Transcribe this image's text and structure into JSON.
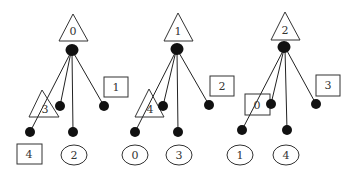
{
  "diagram": {
    "type": "game-tree-set",
    "trees": [
      {
        "root_label": "0",
        "root_shape": "triangle",
        "leaves": [
          {
            "label": "3",
            "shape": "triangle",
            "attached_to": "branch-1"
          },
          {
            "label": "1",
            "shape": "square",
            "attached_to": "branch-4"
          },
          {
            "label": "4",
            "shape": "square",
            "attached_to": "branch-1"
          },
          {
            "label": "2",
            "shape": "circle",
            "attached_to": "branch-3"
          }
        ]
      },
      {
        "root_label": "1",
        "root_shape": "triangle",
        "leaves": [
          {
            "label": "4",
            "shape": "triangle",
            "attached_to": "branch-1"
          },
          {
            "label": "2",
            "shape": "square",
            "attached_to": "branch-4"
          },
          {
            "label": "0",
            "shape": "circle",
            "attached_to": "branch-1"
          },
          {
            "label": "3",
            "shape": "circle",
            "attached_to": "branch-3"
          }
        ]
      },
      {
        "root_label": "2",
        "root_shape": "triangle",
        "leaves": [
          {
            "label": "0",
            "shape": "square",
            "attached_to": "branch-1"
          },
          {
            "label": "3",
            "shape": "square",
            "attached_to": "branch-4"
          },
          {
            "label": "1",
            "shape": "circle",
            "attached_to": "branch-1"
          },
          {
            "label": "4",
            "shape": "circle",
            "attached_to": "branch-3"
          }
        ]
      }
    ]
  },
  "labels": {
    "t0_root": "0",
    "t0_tri": "3",
    "t0_sq_right": "1",
    "t0_sq_bottom": "4",
    "t0_circ": "2",
    "t1_root": "1",
    "t1_tri": "4",
    "t1_sq_right": "2",
    "t1_circ_left": "0",
    "t1_circ_right": "3",
    "t2_root": "2",
    "t2_sq_mid": "0",
    "t2_sq_right": "3",
    "t2_circ_left": "1",
    "t2_circ_right": "4"
  }
}
